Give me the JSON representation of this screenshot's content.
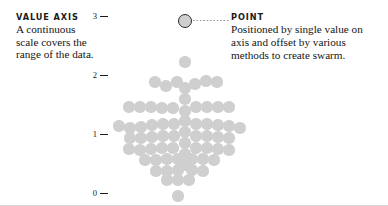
{
  "canvas": {
    "width": 388,
    "height": 206,
    "background": "#ffffff"
  },
  "annotations": {
    "value_axis": {
      "title": "VALUE AXIS",
      "body": "A continuous scale covers the range of the data."
    },
    "point": {
      "title": "POINT",
      "body": "Positioned by single value on axis and offset by various methods to create swarm."
    }
  },
  "axis": {
    "ticks": [
      {
        "label": "3",
        "y": 16
      },
      {
        "label": "2",
        "y": 75
      },
      {
        "label": "1",
        "y": 134
      },
      {
        "label": "0",
        "y": 193
      }
    ],
    "x": 92,
    "range": [
      0,
      3
    ]
  },
  "colors": {
    "dot": "#cfcfcf",
    "highlight_ring": "#2b2b2b",
    "text": "#141414",
    "leader": "#9a9a9a",
    "border": "#d8d8d8"
  },
  "chart_data": {
    "type": "scatter",
    "variant": "beeswarm",
    "title": "",
    "xlabel": "",
    "ylabel": "",
    "ylim": [
      0,
      3
    ],
    "grid": false,
    "legend": null,
    "tick_labels": [
      "3",
      "2",
      "1",
      "0"
    ],
    "dot_radius": 5.6,
    "highlighted_index": 0,
    "annotations": [
      {
        "name": "VALUE AXIS",
        "target": "axis"
      },
      {
        "name": "POINT",
        "target": "highlighted-point"
      }
    ],
    "points": [
      {
        "x": 185,
        "y": 21,
        "value": 2.75,
        "highlight": true
      },
      {
        "x": 185,
        "y": 62,
        "value": 2.05
      },
      {
        "x": 155,
        "y": 82,
        "value": 1.72
      },
      {
        "x": 166,
        "y": 86,
        "value": 1.66
      },
      {
        "x": 177,
        "y": 82,
        "value": 1.72
      },
      {
        "x": 185,
        "y": 88,
        "value": 1.62
      },
      {
        "x": 195,
        "y": 84,
        "value": 1.69
      },
      {
        "x": 206,
        "y": 81,
        "value": 1.74
      },
      {
        "x": 217,
        "y": 82,
        "value": 1.72
      },
      {
        "x": 185,
        "y": 99,
        "value": 1.44
      },
      {
        "x": 129,
        "y": 107,
        "value": 1.31
      },
      {
        "x": 140,
        "y": 107,
        "value": 1.31
      },
      {
        "x": 151,
        "y": 107,
        "value": 1.31
      },
      {
        "x": 162,
        "y": 108,
        "value": 1.29
      },
      {
        "x": 173,
        "y": 108,
        "value": 1.29
      },
      {
        "x": 185,
        "y": 111,
        "value": 1.24
      },
      {
        "x": 196,
        "y": 107,
        "value": 1.31
      },
      {
        "x": 207,
        "y": 107,
        "value": 1.31
      },
      {
        "x": 218,
        "y": 107,
        "value": 1.31
      },
      {
        "x": 229,
        "y": 107,
        "value": 1.31
      },
      {
        "x": 185,
        "y": 121,
        "value": 1.08
      },
      {
        "x": 119,
        "y": 126,
        "value": 1.0
      },
      {
        "x": 130,
        "y": 128,
        "value": 0.97
      },
      {
        "x": 141,
        "y": 127,
        "value": 0.98
      },
      {
        "x": 152,
        "y": 125,
        "value": 1.01
      },
      {
        "x": 163,
        "y": 124,
        "value": 1.03
      },
      {
        "x": 174,
        "y": 124,
        "value": 1.03
      },
      {
        "x": 196,
        "y": 124,
        "value": 1.03
      },
      {
        "x": 207,
        "y": 124,
        "value": 1.03
      },
      {
        "x": 218,
        "y": 125,
        "value": 1.01
      },
      {
        "x": 229,
        "y": 126,
        "value": 1.0
      },
      {
        "x": 240,
        "y": 128,
        "value": 0.97
      },
      {
        "x": 185,
        "y": 132,
        "value": 0.9
      },
      {
        "x": 130,
        "y": 138,
        "value": 0.8
      },
      {
        "x": 141,
        "y": 138,
        "value": 0.8
      },
      {
        "x": 152,
        "y": 137,
        "value": 0.82
      },
      {
        "x": 163,
        "y": 136,
        "value": 0.83
      },
      {
        "x": 174,
        "y": 136,
        "value": 0.83
      },
      {
        "x": 196,
        "y": 136,
        "value": 0.83
      },
      {
        "x": 207,
        "y": 136,
        "value": 0.83
      },
      {
        "x": 218,
        "y": 137,
        "value": 0.82
      },
      {
        "x": 229,
        "y": 138,
        "value": 0.8
      },
      {
        "x": 185,
        "y": 143,
        "value": 0.72
      },
      {
        "x": 129,
        "y": 149,
        "value": 0.62
      },
      {
        "x": 140,
        "y": 150,
        "value": 0.61
      },
      {
        "x": 151,
        "y": 149,
        "value": 0.62
      },
      {
        "x": 162,
        "y": 148,
        "value": 0.64
      },
      {
        "x": 173,
        "y": 148,
        "value": 0.64
      },
      {
        "x": 196,
        "y": 148,
        "value": 0.64
      },
      {
        "x": 207,
        "y": 148,
        "value": 0.64
      },
      {
        "x": 218,
        "y": 149,
        "value": 0.62
      },
      {
        "x": 229,
        "y": 150,
        "value": 0.61
      },
      {
        "x": 185,
        "y": 154,
        "value": 0.54
      },
      {
        "x": 145,
        "y": 160,
        "value": 0.44
      },
      {
        "x": 156,
        "y": 160,
        "value": 0.44
      },
      {
        "x": 167,
        "y": 159,
        "value": 0.46
      },
      {
        "x": 178,
        "y": 159,
        "value": 0.46
      },
      {
        "x": 192,
        "y": 159,
        "value": 0.46
      },
      {
        "x": 203,
        "y": 159,
        "value": 0.46
      },
      {
        "x": 214,
        "y": 160,
        "value": 0.44
      },
      {
        "x": 185,
        "y": 165,
        "value": 0.36
      },
      {
        "x": 156,
        "y": 171,
        "value": 0.26
      },
      {
        "x": 167,
        "y": 171,
        "value": 0.26
      },
      {
        "x": 178,
        "y": 170,
        "value": 0.27
      },
      {
        "x": 192,
        "y": 170,
        "value": 0.27
      },
      {
        "x": 203,
        "y": 171,
        "value": 0.26
      },
      {
        "x": 167,
        "y": 180,
        "value": 0.12
      },
      {
        "x": 178,
        "y": 180,
        "value": 0.12
      },
      {
        "x": 189,
        "y": 180,
        "value": 0.12
      },
      {
        "x": 178,
        "y": 196,
        "value": 0.0
      }
    ]
  }
}
